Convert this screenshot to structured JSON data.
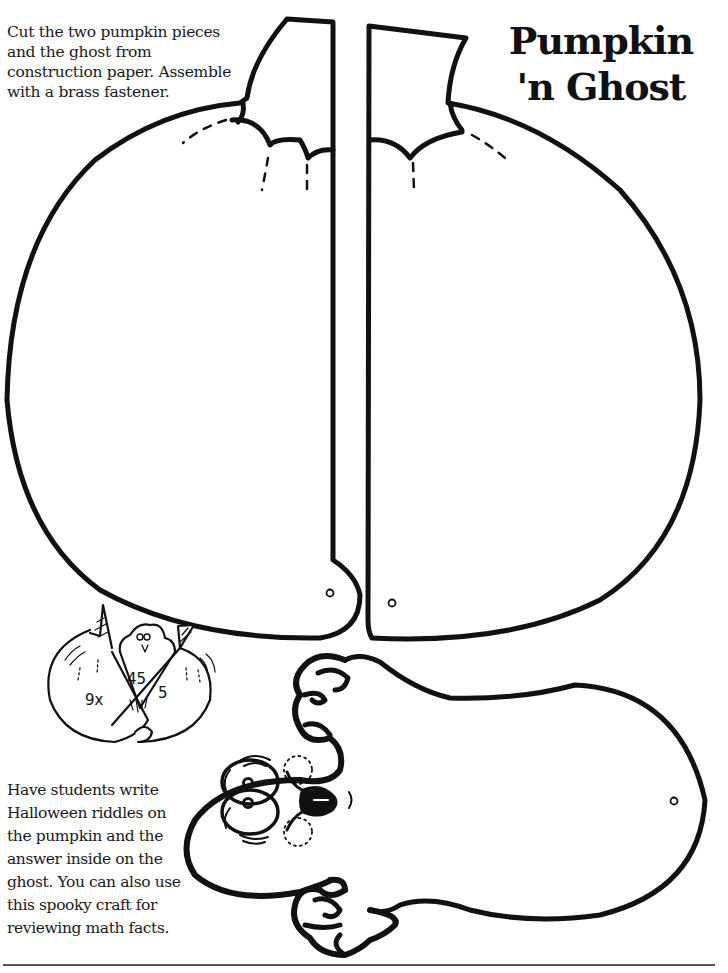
{
  "title": {
    "line1": "Pumpkin",
    "line2": "'n Ghost"
  },
  "instructions": {
    "text": "Cut the two pumpkin pieces and the ghost from construction paper. Assemble with a brass fastener."
  },
  "notes": {
    "text": "Have students write Halloween riddles on the pumpkin and the answer inside on the ghost. You can also use this spooky craft for reviewing math facts."
  },
  "example_illustration": {
    "left_label": "9x",
    "ghost_label": "45",
    "right_label": "5"
  },
  "cutouts": [
    {
      "name": "left pumpkin half",
      "has_fastener_hole": true
    },
    {
      "name": "right pumpkin half",
      "has_fastener_hole": true
    },
    {
      "name": "ghost",
      "has_fastener_hole": true
    }
  ],
  "colors": {
    "ink": "#111111",
    "paper": "#ffffff",
    "rule": "#555555"
  }
}
